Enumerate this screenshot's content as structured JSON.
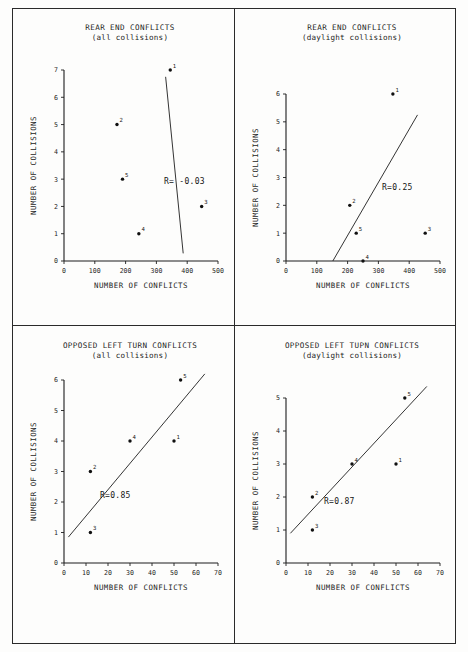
{
  "figure": {
    "caption_none": "",
    "panel_count": 4
  },
  "chart_data": [
    {
      "id": "rear-end-all",
      "type": "scatter",
      "title": "REAR END CONFLICTS",
      "subtitle": "(all collisions)",
      "xlabel": "NUMBER OF CONFLICTS",
      "ylabel": "NUMBER OF COLLISIONS",
      "xlim": [
        0,
        500
      ],
      "ylim": [
        0,
        7
      ],
      "xticks": [
        0,
        100,
        200,
        300,
        400,
        500
      ],
      "yticks": [
        0,
        1,
        2,
        3,
        4,
        5,
        6,
        7
      ],
      "grid": false,
      "legend": "none",
      "annotation": "R= -0.03",
      "correlation": -0.03,
      "points": [
        {
          "label": "1",
          "x": 345,
          "y": 7
        },
        {
          "label": "2",
          "x": 172,
          "y": 5
        },
        {
          "label": "5",
          "x": 190,
          "y": 3
        },
        {
          "label": "3",
          "x": 447,
          "y": 2
        },
        {
          "label": "4",
          "x": 243,
          "y": 1
        }
      ],
      "fitline": {
        "x1": 330,
        "y1": 6.75,
        "x2": 387,
        "y2": 0.28
      }
    },
    {
      "id": "rear-end-daylight",
      "type": "scatter",
      "title": "REAR END CONFLICTS",
      "subtitle": "(daylight collisions)",
      "xlabel": "NUMBER OF CONFLICTS",
      "ylabel": "NUMBER OF COLLISIONS",
      "xlim": [
        0,
        500
      ],
      "ylim": [
        0,
        6
      ],
      "xticks": [
        0,
        100,
        200,
        300,
        400,
        500
      ],
      "yticks": [
        0,
        1,
        2,
        3,
        4,
        5,
        6
      ],
      "grid": false,
      "legend": "none",
      "annotation": "R=0.25",
      "correlation": 0.25,
      "points": [
        {
          "label": "1",
          "x": 347,
          "y": 6
        },
        {
          "label": "2",
          "x": 207,
          "y": 2
        },
        {
          "label": "5",
          "x": 228,
          "y": 1
        },
        {
          "label": "3",
          "x": 452,
          "y": 1
        },
        {
          "label": "4",
          "x": 250,
          "y": 0
        }
      ],
      "fitline": {
        "x1": 152,
        "y1": 0,
        "x2": 427,
        "y2": 5.25
      }
    },
    {
      "id": "opposed-left-turn-all",
      "type": "scatter",
      "title": "OPPOSED LEFT TURN CONFLICTS",
      "subtitle": "(all collisions)",
      "xlabel": "NUMBER OF CONFLICTS",
      "ylabel": "NUMBER OF COLLISIONS",
      "xlim": [
        0,
        70
      ],
      "ylim": [
        0,
        6
      ],
      "xticks": [
        0,
        10,
        20,
        30,
        40,
        50,
        60,
        70
      ],
      "yticks": [
        0,
        1,
        2,
        3,
        4,
        5,
        6
      ],
      "grid": false,
      "legend": "none",
      "annotation": "R=0.85",
      "correlation": 0.85,
      "points": [
        {
          "label": "5",
          "x": 53,
          "y": 6
        },
        {
          "label": "4",
          "x": 30,
          "y": 4
        },
        {
          "label": "1",
          "x": 50,
          "y": 4
        },
        {
          "label": "2",
          "x": 12,
          "y": 3
        },
        {
          "label": "3",
          "x": 12,
          "y": 1
        }
      ],
      "fitline": {
        "x1": 2,
        "y1": 0.85,
        "x2": 64,
        "y2": 6.2
      }
    },
    {
      "id": "opposed-left-turn-daylight",
      "type": "scatter",
      "title": "OPPOSED LEFT TUPN CONFLICTS",
      "subtitle": "(daylight collisions)",
      "xlabel": "NUMBER OF CONFLICTS",
      "ylabel": "NUMBER OF COLLISIONS",
      "xlim": [
        0,
        70
      ],
      "ylim": [
        0,
        5
      ],
      "xticks": [
        0,
        10,
        20,
        30,
        40,
        50,
        60,
        70
      ],
      "yticks": [
        0,
        1,
        2,
        3,
        4,
        5
      ],
      "grid": false,
      "legend": "none",
      "annotation": "R=0.87",
      "correlation": 0.87,
      "points": [
        {
          "label": "5",
          "x": 54,
          "y": 5
        },
        {
          "label": "4",
          "x": 30,
          "y": 3
        },
        {
          "label": "1",
          "x": 50,
          "y": 3
        },
        {
          "label": "2",
          "x": 12,
          "y": 2
        },
        {
          "label": "3",
          "x": 12,
          "y": 1
        }
      ],
      "fitline": {
        "x1": 2,
        "y1": 0.9,
        "x2": 64,
        "y2": 5.35
      }
    }
  ],
  "colors": {
    "ink": "#1d1d1d",
    "paper": "#fdfdfc",
    "dot": "#101010"
  }
}
